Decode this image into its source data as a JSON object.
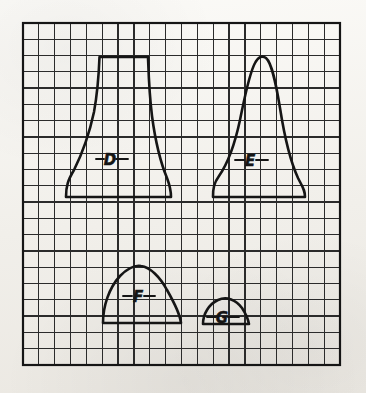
{
  "document": {
    "kind": "hand-drawn graph-paper figure",
    "title": "Four distribution curves on grid paper",
    "background_color": "#f2f0eb",
    "ink_color": "#151515",
    "grid_line_color": "#2b2b2b"
  },
  "grid": {
    "left": 23,
    "top": 23,
    "right": 340,
    "bottom": 365,
    "columns": 20,
    "rows": 21,
    "cell_width": 15.85,
    "cell_height": 16.28,
    "border_width_px": 2.2,
    "line_width_px": 1.25
  },
  "labels": [
    {
      "id": "D",
      "text": "D",
      "x": 110,
      "y": 160,
      "tick_left_x": 96,
      "tick_right_x": 128,
      "tick_y": 159
    },
    {
      "id": "E",
      "text": "E",
      "x": 250,
      "y": 161,
      "tick_left_x": 235,
      "tick_right_x": 268,
      "tick_y": 160
    },
    {
      "id": "F",
      "text": "F",
      "x": 138,
      "y": 297,
      "tick_left_x": 123,
      "tick_right_x": 155,
      "tick_y": 296
    },
    {
      "id": "G",
      "text": "G",
      "x": 222,
      "y": 318,
      "tick_left_x": 207,
      "tick_right_x": 239,
      "tick_y": 317
    }
  ],
  "chart_data": {
    "type": "line",
    "xlabel": "",
    "ylabel": "",
    "grid": true,
    "legend": "inline labels D, E, F, G",
    "series": [
      {
        "name": "D",
        "description": "Wide flat-topped platykurtic distribution with a flat plateau on top and long flared tails",
        "baseline_y": 197,
        "peak_y": 57,
        "left_x": 66,
        "right_x": 171,
        "peak_height_cells": 8.6,
        "base_width_cells": 6.6,
        "shape": "flat-top trapezoid / plateau",
        "path": "M 66 197 C 66 186 68 180 74 170 C 80 158 88 140 94 112 C 98 90 99 70 99.5 57 L 148 57 C 148.5 70 149 92 152 116 C 156 146 162 166 167 178 C 170 186 171 190 171 197 Z"
      },
      {
        "name": "E",
        "description": "Tall narrow peaked leptokurtic bell with a rounded single peak and flared tails",
        "baseline_y": 197,
        "peak_y": 57,
        "left_x": 213,
        "right_x": 305,
        "peak_height_cells": 8.6,
        "base_width_cells": 5.8,
        "shape": "tall narrow bell",
        "path": "M 213 197 C 213 188 214 183 219 176 C 226 166 234 148 240 120 C 245 96 249 74 255 63 C 258 57 262 55 266 58 C 272 63 276 84 280 108 C 285 140 292 165 298 178 C 303 188 305 190 305 197 Z"
      },
      {
        "name": "F",
        "description": "Medium-height broad dome, semicircular arch sitting on the baseline",
        "baseline_y": 323,
        "peak_y": 266,
        "left_x": 103,
        "right_x": 181,
        "peak_height_cells": 3.5,
        "base_width_cells": 4.9,
        "shape": "broad dome",
        "path": "M 103 323 C 103 306 109 288 120 276 C 128 268 135 265 141 266 C 150 267 160 277 167 290 C 175 304 180 314 181 323 Z"
      },
      {
        "name": "G",
        "description": "Small low semicircular hump, smallest of the four",
        "baseline_y": 324,
        "peak_y": 300,
        "left_x": 203,
        "right_x": 249,
        "peak_height_cells": 1.5,
        "base_width_cells": 2.9,
        "shape": "small semicircle",
        "path": "M 203 324 C 203 314 209 304 218 300 C 227 296 236 300 242 308 C 246 314 248 319 249 324 Z"
      }
    ]
  }
}
